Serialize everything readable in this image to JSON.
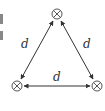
{
  "diagram": {
    "type": "equilateral-triangle-network",
    "colors": {
      "stroke": "#333333",
      "background": "#ffffff"
    },
    "nodes": [
      {
        "id": "top",
        "symbol": "⊗",
        "x": 57,
        "y": 14
      },
      {
        "id": "bottom-left",
        "symbol": "⊗",
        "x": 17,
        "y": 86
      },
      {
        "id": "bottom-right",
        "symbol": "⊗",
        "x": 97,
        "y": 86
      }
    ],
    "edges": [
      {
        "from": "top",
        "to": "bottom-left",
        "label": "d",
        "arrows": "both"
      },
      {
        "from": "top",
        "to": "bottom-right",
        "label": "d",
        "arrows": "both"
      },
      {
        "from": "bottom-left",
        "to": "bottom-right",
        "label": "d",
        "arrows": "both"
      }
    ]
  }
}
